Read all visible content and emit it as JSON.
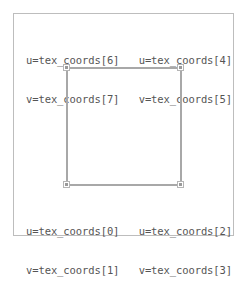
{
  "diagram": {
    "title": "",
    "colors": {
      "frame_border": "#bdbdbd",
      "quad_edge": "#a8a8a8",
      "handle": "#9a9a9a",
      "text": "#555555"
    },
    "corners": {
      "top_left": {
        "u": "u=tex_coords[6]",
        "v": "v=tex_coords[7]"
      },
      "top_right": {
        "u": "u=tex_coords[4]",
        "v": "v=tex_coords[5]"
      },
      "bottom_left": {
        "u": "u=tex_coords[0]",
        "v": "v=tex_coords[1]"
      },
      "bottom_right": {
        "u": "u=tex_coords[2]",
        "v": "v=tex_coords[3]"
      }
    }
  }
}
